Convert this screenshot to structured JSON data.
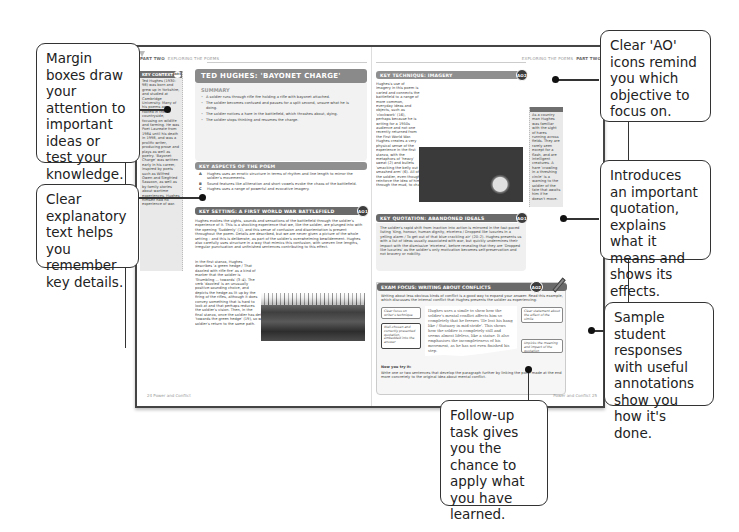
{
  "callouts": {
    "margin_boxes": "Margin boxes draw your attention to important ideas or test your knowledge.",
    "explanatory_text": "Clear explanatory text helps you remember key details.",
    "ao_icons": "Clear 'AO' icons remind you which objective to focus on.",
    "quotation": "Introduces an important quotation, explains what it means and shows its effects.",
    "sample_responses": "Sample student responses with useful annotations show you how it's done.",
    "follow_up": "Follow-up task gives you the chance to apply what you have learned."
  },
  "left_page": {
    "running_head_part": "PART TWO",
    "running_head_section": "EXPLORING THE POEMS",
    "footer": "24 Power and Conflict",
    "key_context": {
      "title": "KEY CONTEXT",
      "ao": "AO3",
      "text": "Ted Hughes (1930–98) was born and grew up in Yorkshire, and studied at Cambridge University. Many of his poems are rooted in the countryside, focusing on wildlife and farming. He was Poet Laureate from 1984 until his death in 1998, and was a prolific writer, producing prose and plays as well as poetry. 'Bayonet Charge' was written early in his career, inspired by poets such as Wilfred Owen and Siegfried Sassoon, as well as by family stories about wartime experiences. Hughes himself had no experience of war."
    },
    "title": "TED HUGHES: 'BAYONET CHARGE'",
    "summary": {
      "heading": "SUMMARY",
      "items": [
        "A soldier runs through rifle fire holding a rifle with bayonet attached.",
        "The soldier becomes confused and pauses for a split second, unsure what he is doing.",
        "The soldier notices a hare in the battlefield, which thrashes about, dying.",
        "The soldier stops thinking and resumes the charge."
      ]
    },
    "key_aspects": {
      "heading": "KEY ASPECTS OF THE POEM",
      "items": [
        {
          "letter": "A",
          "text": "Hughes uses an erratic structure in terms of rhythm and line length to mirror the soldier's movements."
        },
        {
          "letter": "B",
          "text": "Sound features like alliteration and short vowels evoke the chaos of the battlefield."
        },
        {
          "letter": "C",
          "text": "Hughes uses a range of powerful and evocative imagery."
        }
      ]
    },
    "key_setting": {
      "heading": "KEY SETTING: A FIRST WORLD WAR BATTLEFIELD",
      "ao": "AO1",
      "para1": "Hughes evokes the sights, sounds and sensations of the battlefield through the soldier's experience of it. This is a shocking experience that we, like the soldier, are plunged into with the opening 'Suddenly' (1), and this sense of confusion and disorientation is present throughout the poem. Details are described, but we are never given a picture of the whole setting – and this is deliberate, as part of the soldier's overwhelming bewilderment. Hughes also carefully uses structure in a way that mimics this confusion, with uneven line lengths, irregular punctuation and unfinished sentences contributing to this effect.",
      "para2": "In the first stanza, Hughes describes 'a green hedge / That dazzled with rifle fire' as a kind of marker that the soldier is 'Stumbling ... towards' (3–4). The verb 'dazzled' is an unusually positive-sounding choice, and depicts the hedge as lit up by the firing of the rifles, although it does convey something that is hard to look at and that perhaps reduces the soldier's vision. Then, in the final stanza, once the soldier has determined to continue charging, he plunges once more 'towards the green hedge' (19), so we can see that Hughes repeats the phrase to show the soldier's return to the same path."
    }
  },
  "right_page": {
    "running_head_section": "EXPLORING THE POEMS",
    "running_head_part": "PART TWO",
    "footer": "Power and Conflict 25",
    "key_technique": {
      "heading": "KEY TECHNIQUE: IMAGERY",
      "ao": "AO2",
      "text": "Hughes's use of imagery in this poem is varied and connects the battlefield to a range of more common, everyday ideas and objects, such as 'clockwork' (16), perhaps because he is writing for a 1950s audience and not one recently returned from the First World War. Hughes creates a very physical sense of the experience in the first stanza, with the metaphors of 'heavy' sweat (2) and bullets 'smacking the belly out of the air' (5), along with the simile 'a rifle numb as a smashed arm' (6). All of this bodily imagery focuses heavily on the physicality of the soldier, even though most of it is not actually about him. The effect is to reinforce the idea of him physically struggling to drag himself across the field, through the mud, to charge at the enemy."
    },
    "margin_note": "As a country man Hughes was familiar with the sight of hares running across fields. They are rarely seen except for a flash, and are intelligent creatures. A hare 'crawling in a threshing circle' is a warning to the soldier of the fate that awaits him if he doesn't move.",
    "key_quotation": {
      "heading": "KEY QUOTATION: ABANDONED IDEALS",
      "ao": "AO1",
      "text": "The soldier's rapid shift from inaction into action is mirrored in the fast-paced listing 'King, honour, human dignity, etcetera / Dropped like luxuries in a yelling alarm / To get out of that blue crackling air' (20–2). Hughes presents us with a list of ideas usually associated with war, but quickly undermines their impact with the dismissive 'etcetera', before revealing that they are 'Dropped like luxuries' as the soldier's only motivation becomes self-preservation and not bravery or nobility."
    },
    "exam_focus": {
      "heading": "EXAM FOCUS: WRITING ABOUT CONFLICTS",
      "ao": "AO2",
      "intro": "Writing about less obvious kinds of conflict is a good way to expand your answer. Read this example, which discusses the internal conflict that Hughes presents the soldier as experiencing:",
      "sample": "Hughes uses a simile to show how the soldier's mental conflict affects him so completely that he freezes 'He lost his bang like / Statuary in mid-stride'. This shows how the soldier is completely still and seems almost lifeless, like a statue. It also emphasises the incompleteness of his movement, as he has not even finished his step.",
      "annotations": [
        "Clear focus on writer's technique",
        "Well-chosen and correctly presented quotation, embedded into the answer",
        "Clear statement about the effect of the simile",
        "Unpicks the meaning and impact of the quotation"
      ],
      "now_you_try_heading": "Now you try it:",
      "now_you_try": "Write one or two sentences that develop the paragraph further by linking the point made at the end more concretely to the original idea about mental conflict."
    }
  }
}
